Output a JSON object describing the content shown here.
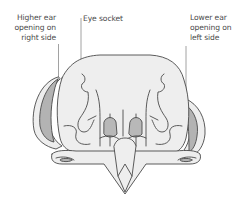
{
  "diagram": {
    "labels": [
      {
        "id": "higher-ear",
        "lines": [
          "Higher ear",
          "opening on",
          "right side"
        ]
      },
      {
        "id": "eye-socket",
        "lines": [
          "Eye socket"
        ]
      },
      {
        "id": "lower-ear",
        "lines": [
          "Lower ear",
          "opening on",
          "left side"
        ]
      }
    ],
    "colors": {
      "outline": "#4a4a4a",
      "bone_fill": "#eeeeee",
      "ear_opening_fill": "#b3b3b3",
      "nasal_fill": "#b8b8b8",
      "leader_line": "#8a8a8a",
      "text": "#4a4a4a"
    }
  }
}
